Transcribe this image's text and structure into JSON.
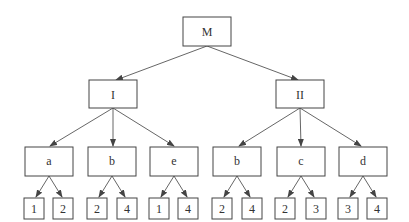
{
  "diagram": {
    "type": "tree",
    "colors": {
      "stroke": "#444444",
      "text": "#333333",
      "background": "#ffffff"
    },
    "root": {
      "id": "M",
      "label": "M"
    },
    "level1": [
      {
        "id": "I",
        "label": "I"
      },
      {
        "id": "II",
        "label": "II"
      }
    ],
    "level2": [
      {
        "id": "a",
        "label": "a",
        "parent": "I"
      },
      {
        "id": "b1",
        "label": "b",
        "parent": "I"
      },
      {
        "id": "e",
        "label": "e",
        "parent": "I"
      },
      {
        "id": "b2",
        "label": "b",
        "parent": "II"
      },
      {
        "id": "c",
        "label": "c",
        "parent": "II"
      },
      {
        "id": "d",
        "label": "d",
        "parent": "II"
      }
    ],
    "leaves": [
      {
        "label": "1",
        "parent": "a"
      },
      {
        "label": "2",
        "parent": "a"
      },
      {
        "label": "2",
        "parent": "b1"
      },
      {
        "label": "4",
        "parent": "b1"
      },
      {
        "label": "1",
        "parent": "e"
      },
      {
        "label": "4",
        "parent": "e"
      },
      {
        "label": "2",
        "parent": "b2"
      },
      {
        "label": "4",
        "parent": "b2"
      },
      {
        "label": "2",
        "parent": "c"
      },
      {
        "label": "3",
        "parent": "c"
      },
      {
        "label": "3",
        "parent": "d"
      },
      {
        "label": "4",
        "parent": "d"
      }
    ]
  }
}
